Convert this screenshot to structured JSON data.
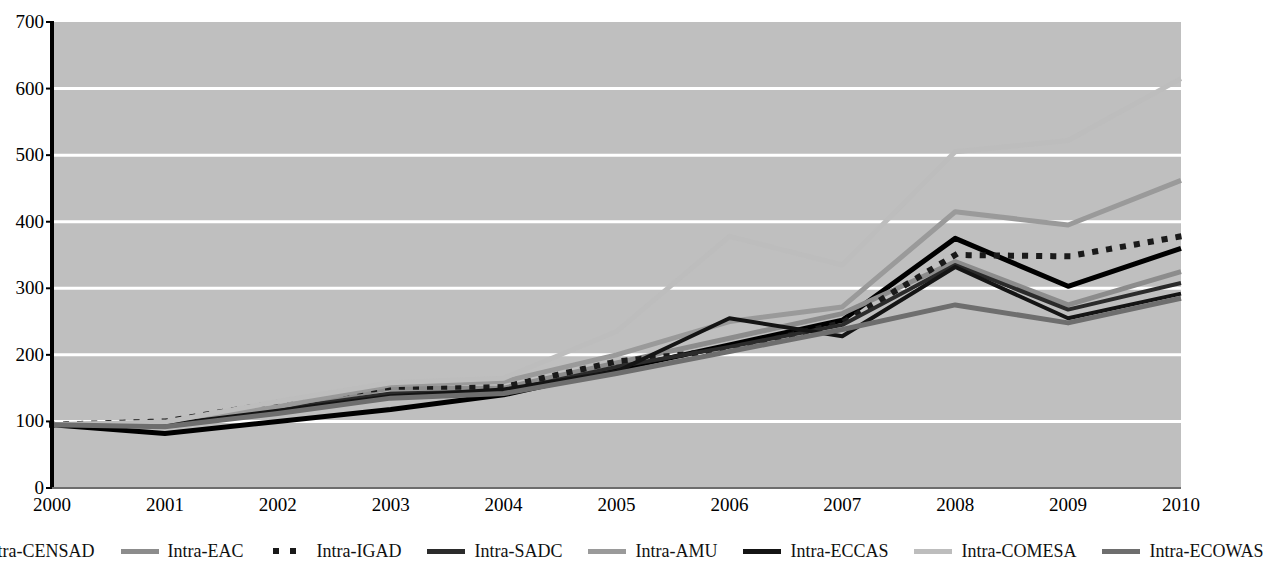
{
  "title": "",
  "chart_data": {
    "type": "line",
    "title": "",
    "xlabel": "",
    "ylabel": "",
    "ylim": [
      0,
      700
    ],
    "ytick_step": 100,
    "yticks": [
      0,
      100,
      200,
      300,
      400,
      500,
      600,
      700
    ],
    "grid": true,
    "legend_position": "bottom",
    "categories": [
      "2000",
      "2001",
      "2002",
      "2003",
      "2004",
      "2005",
      "2006",
      "2007",
      "2008",
      "2009",
      "2010"
    ],
    "x": [
      "2000",
      "2001",
      "2002",
      "2003",
      "2004",
      "2005",
      "2006",
      "2007",
      "2008",
      "2009",
      "2010"
    ],
    "series": [
      {
        "name": "Intra-CENSAD",
        "color": "#000000",
        "style": "solid",
        "width": 5,
        "values": [
          95,
          82,
          100,
          118,
          140,
          178,
          215,
          252,
          375,
          303,
          360
        ]
      },
      {
        "name": "Intra-EAC",
        "color": "#8c8c8c",
        "style": "solid",
        "width": 5,
        "values": [
          95,
          97,
          120,
          150,
          150,
          188,
          225,
          262,
          340,
          275,
          325
        ]
      },
      {
        "name": "Intra-IGAD",
        "color": "#1a1a1a",
        "style": "dotted",
        "width": 6,
        "values": [
          95,
          100,
          128,
          152,
          152,
          190,
          208,
          248,
          350,
          348,
          378
        ]
      },
      {
        "name": "Intra-SADC",
        "color": "#2b2b2b",
        "style": "solid",
        "width": 4,
        "values": [
          95,
          96,
          118,
          142,
          145,
          182,
          212,
          245,
          335,
          268,
          308
        ]
      },
      {
        "name": "Intra-AMU",
        "color": "#9a9a9a",
        "style": "solid",
        "width": 5,
        "values": [
          95,
          98,
          122,
          155,
          160,
          200,
          250,
          272,
          415,
          395,
          462
        ]
      },
      {
        "name": "Intra-ECCAS",
        "color": "#141414",
        "style": "solid",
        "width": 4,
        "values": [
          95,
          95,
          116,
          138,
          148,
          175,
          255,
          228,
          332,
          255,
          292
        ]
      },
      {
        "name": "Intra-COMESA",
        "color": "#bdbdbd",
        "style": "solid",
        "width": 5,
        "values": [
          95,
          99,
          130,
          158,
          165,
          235,
          378,
          335,
          505,
          522,
          615
        ]
      },
      {
        "name": "Intra-ECOWAS",
        "color": "#6e6e6e",
        "style": "solid",
        "width": 5,
        "values": [
          95,
          92,
          112,
          135,
          142,
          172,
          205,
          238,
          275,
          248,
          285
        ]
      }
    ]
  },
  "plot": {
    "background_color": "#bfbfbf",
    "gridline_color": "#ffffff",
    "axis_color": "#000000"
  },
  "legend": {
    "items": [
      {
        "label": "Intra-CENSAD",
        "color": "#000000",
        "style": "solid"
      },
      {
        "label": "Intra-EAC",
        "color": "#8c8c8c",
        "style": "solid"
      },
      {
        "label": "Intra-IGAD",
        "color": "#1a1a1a",
        "style": "dotted"
      },
      {
        "label": "Intra-SADC",
        "color": "#2b2b2b",
        "style": "solid"
      },
      {
        "label": "Intra-AMU",
        "color": "#9a9a9a",
        "style": "solid"
      },
      {
        "label": "Intra-ECCAS",
        "color": "#141414",
        "style": "solid"
      },
      {
        "label": "Intra-COMESA",
        "color": "#bdbdbd",
        "style": "solid"
      },
      {
        "label": "Intra-ECOWAS",
        "color": "#6e6e6e",
        "style": "solid"
      }
    ]
  }
}
